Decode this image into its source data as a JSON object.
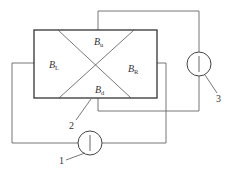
{
  "diagram": {
    "regions": {
      "up": {
        "main": "B",
        "sub": "u"
      },
      "down": {
        "main": "B",
        "sub": "d"
      },
      "left": {
        "main": "B",
        "sub": "L"
      },
      "right": {
        "main": "B",
        "sub": "R"
      }
    },
    "callouts": {
      "one": "1",
      "two": "2",
      "three": "3"
    },
    "colors": {
      "line": "#555555",
      "rect": "#333333"
    }
  }
}
